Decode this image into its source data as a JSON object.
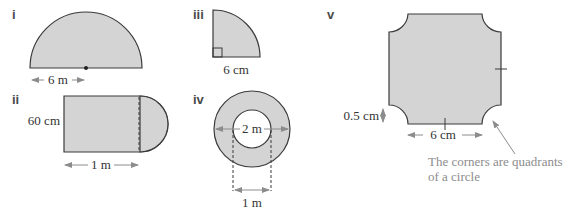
{
  "figures": [
    {
      "label": "i",
      "shape": "semicircle",
      "dimension": "6 m",
      "measured": "radius"
    },
    {
      "label": "ii",
      "shape": "rectangle with semicircle",
      "dimensions": [
        "60 cm",
        "1 m"
      ]
    },
    {
      "label": "iii",
      "shape": "quadrant",
      "dimension": "6 cm"
    },
    {
      "label": "iv",
      "shape": "annulus",
      "dimensions": [
        "2 m",
        "1 m"
      ]
    },
    {
      "label": "v",
      "shape": "square with quadrant corners removed",
      "dimensions": [
        "0.5 cm",
        "6 cm"
      ],
      "note": [
        "The corners are quadrants",
        "of a circle"
      ]
    }
  ],
  "colors": {
    "fill": "#d4d4d4",
    "outline": "#3a3a3a",
    "annotation": "#8c8c8c"
  }
}
